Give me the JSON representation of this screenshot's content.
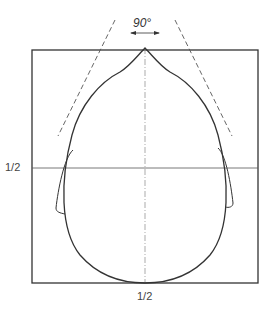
{
  "diagram": {
    "angle_label": "90°",
    "horizontal_mid_label": "1/2",
    "vertical_mid_label": "1/2",
    "colors": {
      "line": "#333333",
      "guide": "#666666",
      "background": "#ffffff"
    }
  }
}
